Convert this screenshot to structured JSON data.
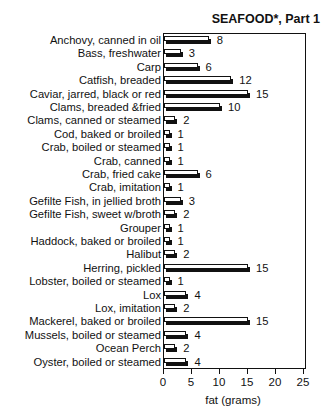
{
  "chart_data": {
    "type": "bar",
    "orientation": "horizontal",
    "title": "SEAFOOD*, Part 1",
    "xlabel": "fat (grams)",
    "ylabel": "",
    "xlim": [
      0,
      25
    ],
    "xticks": [
      0,
      5,
      10,
      15,
      20,
      25
    ],
    "grid": false,
    "legend": null,
    "categories": [
      "Anchovy, canned in oil",
      "Bass, freshwater",
      "Carp",
      "Catfish, breaded",
      "Caviar, jarred, black or red",
      "Clams, breaded &fried",
      "Clams, canned or steamed",
      "Cod, baked or broiled",
      "Crab, boiled or steamed",
      "Crab, canned",
      "Crab, fried cake",
      "Crab, imitation",
      "Gefilte Fish, in jellied broth",
      "Gefilte Fish, sweet w/broth",
      "Grouper",
      "Haddock, baked or broiled",
      "Halibut",
      "Herring, pickled",
      "Lobster,  boiled or steamed",
      "Lox",
      "Lox,  imitation",
      "Mackerel, baked or broiled",
      "Mussels, boiled or steamed",
      "Ocean Perch",
      "Oyster, boiled or steamed"
    ],
    "values": [
      8,
      3,
      6,
      12,
      15,
      10,
      2,
      1,
      1,
      1,
      6,
      1,
      3,
      2,
      1,
      1,
      2,
      15,
      1,
      4,
      2,
      15,
      4,
      2,
      4
    ],
    "value_labels": [
      "8",
      "3",
      "6",
      "12",
      "15",
      "10",
      "2",
      "1",
      "1",
      "1",
      "6",
      "1",
      "3",
      "2",
      "1",
      "1",
      "2",
      "15",
      "1",
      "4",
      "2",
      "15",
      "4",
      "2",
      "4"
    ]
  },
  "colors": {
    "ink": "#111111",
    "bar_fill": "#ffffff",
    "bar_shadow": "#111111",
    "background": "#ffffff"
  }
}
